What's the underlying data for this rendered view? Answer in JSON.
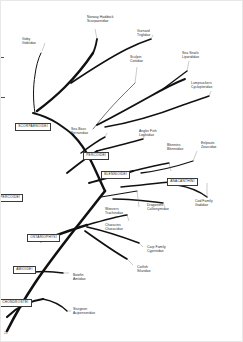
{
  "figure": {
    "type": "phylogenetic-tree",
    "page_marker": "23",
    "background_color": "#ffffff",
    "branch_color": "#111111",
    "leader_color": "#777777",
    "label_color": "#2b2b2b",
    "box_border_color": "#3a3a3a"
  },
  "taxa": [
    {
      "id": "goby",
      "common": "Goby",
      "family": "Gobiidae"
    },
    {
      "id": "norway-haddock",
      "common": "Norway Haddock",
      "family": "Scorpaenidae"
    },
    {
      "id": "gurnard",
      "common": "Gurnard",
      "family": "Triglidae"
    },
    {
      "id": "sculpin",
      "common": "Sculpin",
      "family": "Cottidae"
    },
    {
      "id": "sea-snails",
      "common": "Sea Snails",
      "family": "Liparididae"
    },
    {
      "id": "lumpsuckers",
      "common": "Lumpsuckers",
      "family": "Cyclopteridae"
    },
    {
      "id": "sea-bass",
      "common": "Sea Bass",
      "family": "Serranidae"
    },
    {
      "id": "angler-fish",
      "common": "Angler Fish",
      "family": "Lophiidae"
    },
    {
      "id": "blennies",
      "common": "Blennies",
      "family": "Blenniidae"
    },
    {
      "id": "eelpouts",
      "common": "Eelpouts",
      "family": "Zoarcidae"
    },
    {
      "id": "weevers",
      "common": "Weevers",
      "family": "Trachinidae"
    },
    {
      "id": "dragonets",
      "common": "Dragonets",
      "family": "Callionymidae"
    },
    {
      "id": "cod-family",
      "common": "Cod Family",
      "family": "Gadidae"
    },
    {
      "id": "characins",
      "common": "Characins",
      "family": "Characidae"
    },
    {
      "id": "carp-family",
      "common": "Carp Family",
      "family": "Cyprinidae"
    },
    {
      "id": "catfish",
      "common": "Catfish",
      "family": "Siluridae"
    },
    {
      "id": "bowfin",
      "common": "Bowfin",
      "family": "Amiidae"
    },
    {
      "id": "sturgeon",
      "common": "Sturgeon",
      "family": "Acipenseridae"
    }
  ],
  "clades": [
    {
      "id": "scorpaenoidei",
      "label": "SCORPAENOIDEI"
    },
    {
      "id": "percoidei-upper",
      "label": "PERCOIDEI"
    },
    {
      "id": "blennioidei",
      "label": "BLENNIOIDEI"
    },
    {
      "id": "anacanthini",
      "label": "ANACANTHINI"
    },
    {
      "id": "percoidei-left",
      "label": "PERCOIDEI"
    },
    {
      "id": "ostariophysi",
      "label": "OSTARIOPHYSI"
    },
    {
      "id": "amioidei",
      "label": "AMIOIDEI"
    },
    {
      "id": "chondrostei",
      "label": "CHONDROSTEI"
    }
  ]
}
